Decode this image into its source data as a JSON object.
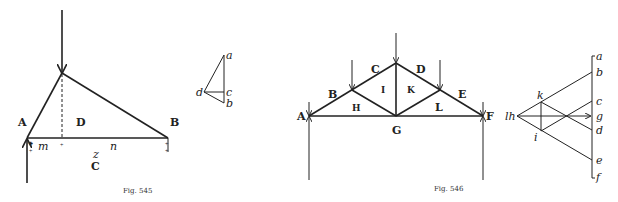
{
  "fig545": {
    "caption": "Fig. 545",
    "labels": {
      "A": "A",
      "D": "D",
      "B": "B",
      "m": "m",
      "n": "n",
      "z": "z",
      "C": "C"
    },
    "force_polygon": {
      "a": "a",
      "b": "b",
      "c": "c",
      "d": "d"
    }
  },
  "fig546": {
    "caption": "Fig. 546",
    "labels": {
      "A": "A",
      "B": "B",
      "C": "C",
      "D": "D",
      "E": "E",
      "F": "F",
      "G": "G",
      "H": "H",
      "I": "I",
      "K": "K",
      "L": "L"
    },
    "force_polygon": {
      "a": "a",
      "b": "b",
      "c": "c",
      "g": "g",
      "d": "d",
      "e": "e",
      "f": "f",
      "h": "lh",
      "k": "k",
      "i": "i"
    }
  },
  "colors": {
    "ink": "#222222",
    "background": "#ffffff"
  }
}
